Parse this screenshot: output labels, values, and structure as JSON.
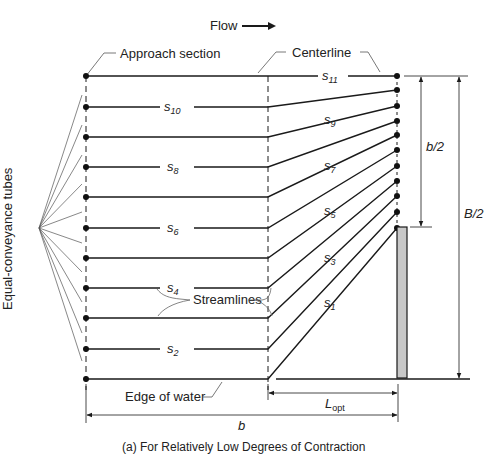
{
  "diagram": {
    "flow_label": "Flow",
    "approach_label": "Approach section",
    "centerline_label": "Centerline",
    "tubes_label": "Equal-conveyance tubes",
    "streamlines_label": "Streamlines",
    "edge_label": "Edge of water",
    "b_half_label": "b/2",
    "B_half_label": "B/2",
    "b_label": "b",
    "L_label": "L",
    "L_sub": "opt",
    "caption": "(a) For Relatively Low Degrees of Contraction",
    "streamline_labels": [
      {
        "s": "s",
        "n": "11"
      },
      {
        "s": "s",
        "n": "10"
      },
      {
        "s": "s",
        "n": "9"
      },
      {
        "s": "s",
        "n": "8"
      },
      {
        "s": "s",
        "n": "7"
      },
      {
        "s": "s",
        "n": "6"
      },
      {
        "s": "s",
        "n": "5"
      },
      {
        "s": "s",
        "n": "4"
      },
      {
        "s": "s",
        "n": "3"
      },
      {
        "s": "s",
        "n": "2"
      },
      {
        "s": "s",
        "n": "1"
      }
    ],
    "colors": {
      "line": "#1a1a1a",
      "pier_fill": "#c8c8c8",
      "thin": "#555555"
    }
  }
}
